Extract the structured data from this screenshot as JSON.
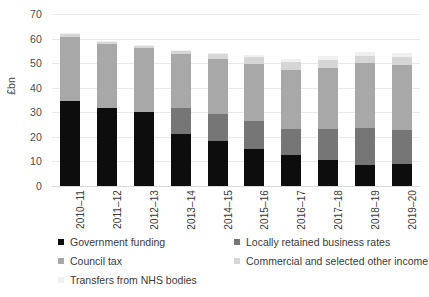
{
  "chart_data": {
    "type": "bar",
    "stacked": true,
    "title": "",
    "xlabel": "",
    "ylabel": "£bn",
    "ylim": [
      0,
      70
    ],
    "ytick_step": 10,
    "yticks": [
      0,
      10,
      20,
      30,
      40,
      50,
      60,
      70
    ],
    "grid": true,
    "legend_position": "bottom",
    "categories": [
      "2010–11",
      "2011–12",
      "2012–13",
      "2013–14",
      "2014–15",
      "2015–16",
      "2016–17",
      "2017–18",
      "2018–19",
      "2019–20"
    ],
    "series": [
      {
        "name": "Government funding",
        "color": "#0d0d0d",
        "values": [
          34.4,
          31.7,
          30.1,
          21.3,
          18.4,
          15.2,
          12.6,
          10.5,
          8.6,
          8.9
        ]
      },
      {
        "name": "Locally retained business rates",
        "color": "#767676",
        "values": [
          0.0,
          0.0,
          0.0,
          10.4,
          10.9,
          11.3,
          10.8,
          12.8,
          15.0,
          14.1
        ]
      },
      {
        "name": "Council tax",
        "color": "#a8a8a8",
        "values": [
          26.4,
          26.1,
          25.9,
          22.2,
          22.2,
          23.0,
          23.9,
          24.9,
          26.3,
          26.2
        ]
      },
      {
        "name": "Commercial and selected other income",
        "color": "#d6d6d6",
        "values": [
          1.0,
          0.9,
          0.9,
          0.9,
          2.3,
          3.0,
          3.0,
          3.0,
          3.1,
          3.2
        ]
      },
      {
        "name": "Transfers from NHS bodies",
        "color": "#f0f0f0",
        "values": [
          0.4,
          0.4,
          0.4,
          0.4,
          0.4,
          1.0,
          1.3,
          1.6,
          1.7,
          1.7
        ]
      }
    ]
  },
  "axis": {
    "y_title": "£bn",
    "y_tick_labels": [
      "0",
      "10",
      "20",
      "30",
      "40",
      "50",
      "60",
      "70"
    ],
    "x_tick_labels": [
      "2010–11",
      "2011–12",
      "2012–13",
      "2013–14",
      "2014–15",
      "2015–16",
      "2016–17",
      "2017–18",
      "2018–19",
      "2019–20"
    ]
  },
  "legend": {
    "rows": [
      [
        {
          "label": "Government funding",
          "color": "#0d0d0d"
        },
        {
          "label": "Locally retained business rates",
          "color": "#767676"
        }
      ],
      [
        {
          "label": "Council tax",
          "color": "#a8a8a8"
        },
        {
          "label": "Commercial and selected other income",
          "color": "#d6d6d6"
        }
      ],
      [
        {
          "label": "Transfers from NHS bodies",
          "color": "#f0f0f0"
        }
      ]
    ]
  }
}
